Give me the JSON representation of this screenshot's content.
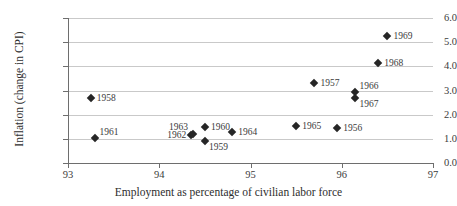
{
  "chart_data": {
    "type": "scatter",
    "title": "",
    "xlabel": "Employment as percentage of civilian labor force",
    "ylabel": "Inflation (change in CPI)",
    "xlim": [
      93,
      97
    ],
    "ylim": [
      0.0,
      6.0
    ],
    "xticks": [
      "93",
      "94",
      "95",
      "96",
      "97"
    ],
    "yticks": [
      "0.0",
      "1.0",
      "2.0",
      "3.0",
      "4.0",
      "5.0",
      "6.0"
    ],
    "grid": "horizontal",
    "legend": "none",
    "marker_color": "#262626",
    "gridline_color": "#c9c9c9",
    "axis_color": "#6e6e6e",
    "points": [
      {
        "label": "1956",
        "x": 95.95,
        "y": 1.45,
        "label_pos": "right"
      },
      {
        "label": "1957",
        "x": 95.7,
        "y": 3.3,
        "label_pos": "right"
      },
      {
        "label": "1958",
        "x": 93.25,
        "y": 2.7,
        "label_pos": "right"
      },
      {
        "label": "1959",
        "x": 94.5,
        "y": 0.9,
        "label_pos": "se"
      },
      {
        "label": "1960",
        "x": 94.5,
        "y": 1.5,
        "label_pos": "right"
      },
      {
        "label": "1961",
        "x": 93.3,
        "y": 1.05,
        "label_pos": "ne"
      },
      {
        "label": "1962",
        "x": 94.35,
        "y": 1.15,
        "label_pos": "w"
      },
      {
        "label": "1963",
        "x": 94.37,
        "y": 1.22,
        "label_pos": "nw"
      },
      {
        "label": "1964",
        "x": 94.8,
        "y": 1.3,
        "label_pos": "right"
      },
      {
        "label": "1965",
        "x": 95.5,
        "y": 1.55,
        "label_pos": "right"
      },
      {
        "label": "1966",
        "x": 96.15,
        "y": 2.92,
        "label_pos": "ne"
      },
      {
        "label": "1967",
        "x": 96.15,
        "y": 2.7,
        "label_pos": "se"
      },
      {
        "label": "1968",
        "x": 96.4,
        "y": 4.15,
        "label_pos": "right"
      },
      {
        "label": "1969",
        "x": 96.5,
        "y": 5.25,
        "label_pos": "right"
      }
    ]
  }
}
